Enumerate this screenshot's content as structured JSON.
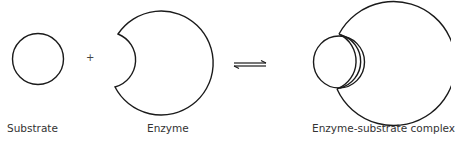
{
  "diagram": {
    "plus_sign": "+",
    "labels": {
      "substrate": "Substrate",
      "enzyme": "Enzyme",
      "complex": "Enzyme-substrate complex"
    },
    "equilibrium_symbol": "reversible-arrows",
    "stroke_color": "#1a1a1a",
    "background_color": "#ffffff"
  }
}
